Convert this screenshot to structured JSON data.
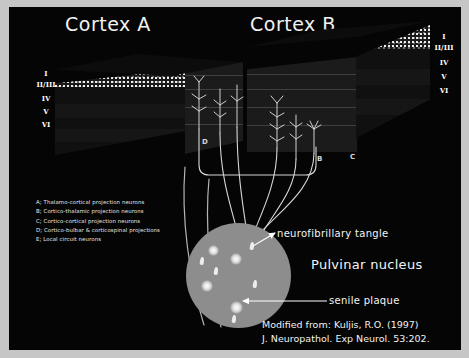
{
  "slide": {
    "background_color": "#050505",
    "frame_color": "#c6c6c6",
    "accent_color": "#ffffff",
    "nucleus_color": "#8d8d8d"
  },
  "titles": {
    "cortex_a": "Cortex A",
    "cortex_b": "Cortex B"
  },
  "layers": {
    "left": [
      "I",
      "II/III",
      "IV",
      "V",
      "VI"
    ],
    "right": [
      "I",
      "II/III",
      "IV",
      "V",
      "VI"
    ]
  },
  "block_letters": {
    "d": "D",
    "b": "B",
    "c": "C"
  },
  "legend": {
    "items": [
      "A; Thalamo-cortical projection neurons",
      "B; Cortico-thalamic projection neurons",
      "C; Cortico-cortical projection neurons",
      "D; Cortico-bulbar & corticospinal projections",
      "E; Local circuit neurons"
    ]
  },
  "callouts": {
    "neurofibrillary_tangle": "neurofibrillary tangle",
    "senile_plaque": "senile plaque",
    "pulvinar_nucleus": "Pulvinar nucleus"
  },
  "citation": {
    "line1": "Modified from: Kuljis, R.O. (1997)",
    "line2": "J. Neuropathol. Exp Neurol. 53:202."
  }
}
